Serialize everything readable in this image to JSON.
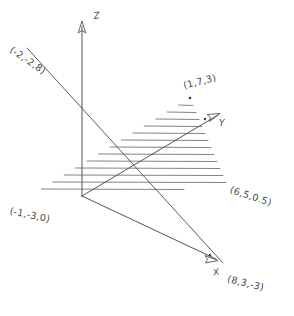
{
  "figure": {
    "background_color": "#ffffff",
    "ink_color": "#4a4a4a",
    "width": 294,
    "height": 316
  },
  "axes": [
    {
      "id": "z",
      "label": "Z",
      "label_x": 93,
      "label_y": 11,
      "rotation": -8
    },
    {
      "id": "y",
      "label": "Y",
      "label_x": 219,
      "label_y": 118,
      "rotation": 0
    },
    {
      "id": "x",
      "label": "X",
      "label_x": 212,
      "label_y": 268,
      "rotation": -12
    }
  ],
  "points": [
    {
      "id": "p-neg2-neg2-8",
      "label": "(-2,-2,8)",
      "x": 14,
      "y": 44,
      "rotation": 34,
      "vertex_x": 27,
      "vertex_y": 48
    },
    {
      "id": "p-1-7-3",
      "label": "(1,7,3)",
      "x": 182,
      "y": 80,
      "rotation": -14,
      "vertex_x": 190,
      "vertex_y": 98
    },
    {
      "id": "p-6-5-0p5",
      "label": "(6,5,0.5)",
      "x": 232,
      "y": 184,
      "rotation": 18,
      "vertex_x": 228,
      "vertex_y": 187
    },
    {
      "id": "p-neg1-neg3-0",
      "label": "(-1,-3,0)",
      "x": 11,
      "y": 205,
      "rotation": 12,
      "vertex_x": 30,
      "vertex_y": 196
    },
    {
      "id": "p-8-3-neg3",
      "label": "(8,3,-3)",
      "x": 229,
      "y": 273,
      "rotation": 14,
      "vertex_x": 224,
      "vertex_y": 264
    }
  ],
  "geometry": {
    "origin": {
      "x": 82,
      "y": 196
    },
    "z_axis": {
      "x1": 82,
      "y1": 196,
      "x2": 82,
      "y2": 26
    },
    "y_axis": {
      "x1": 82,
      "y1": 196,
      "x2": 218,
      "y2": 115
    },
    "x_axis": {
      "x1": 82,
      "y1": 196,
      "x2": 216,
      "y2": 259
    },
    "diagonal_guide": {
      "x1": 27,
      "y1": 48,
      "x2": 223,
      "y2": 263
    },
    "plane_triangle": [
      {
        "x": 30,
        "y": 196
      },
      {
        "x": 190,
        "y": 98
      },
      {
        "x": 228,
        "y": 187
      }
    ],
    "hatch_count": 13,
    "hatch_direction": "horizontal"
  }
}
